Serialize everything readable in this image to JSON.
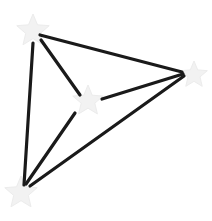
{
  "diagram": {
    "type": "graph",
    "background": "#ffffff",
    "edge_color": "#1a1a1a",
    "node_color": "#f2f2f2",
    "node_stroke": "#ececec",
    "nodes": [
      {
        "id": "A",
        "shape": "star",
        "x": 33,
        "y": 31,
        "r": 17
      },
      {
        "id": "B",
        "shape": "star",
        "x": 194,
        "y": 75,
        "r": 14
      },
      {
        "id": "C",
        "shape": "star",
        "x": 88,
        "y": 101,
        "r": 16
      },
      {
        "id": "D",
        "shape": "star",
        "x": 21,
        "y": 193,
        "r": 17
      }
    ],
    "edges": [
      {
        "from": "A",
        "to": "B",
        "x1": 40,
        "y1": 35,
        "x2": 182,
        "y2": 72
      },
      {
        "from": "A",
        "to": "C",
        "x1": 41,
        "y1": 40,
        "x2": 80,
        "y2": 95
      },
      {
        "from": "A",
        "to": "D",
        "x1": 33,
        "y1": 43,
        "x2": 24,
        "y2": 185
      },
      {
        "from": "B",
        "to": "C",
        "x1": 183,
        "y1": 74,
        "x2": 102,
        "y2": 99
      },
      {
        "from": "B",
        "to": "D",
        "x1": 184,
        "y1": 76,
        "x2": 30,
        "y2": 186
      },
      {
        "from": "C",
        "to": "D",
        "x1": 75,
        "y1": 113,
        "x2": 26,
        "y2": 184
      }
    ]
  }
}
